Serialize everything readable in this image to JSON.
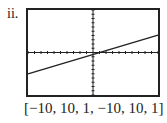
{
  "problem_label": "ii.",
  "window_caption": "[−10, 10, 1, −10, 10, 1]",
  "chart_data": {
    "type": "line",
    "title": "",
    "xlabel": "",
    "ylabel": "",
    "xlim": [
      -10,
      10
    ],
    "ylim": [
      -10,
      10
    ],
    "xscale": 1,
    "yscale": 1,
    "grid": false,
    "axes_ticks": true,
    "series": [
      {
        "name": "line",
        "x": [
          -10,
          10
        ],
        "y": [
          -5,
          4.1
        ]
      }
    ],
    "annotations": [
      "[−10, 10, 1, −10, 10, 1]"
    ]
  }
}
